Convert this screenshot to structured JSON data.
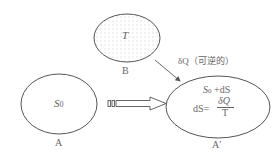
{
  "diagram": {
    "nodes": {
      "A": {
        "label": "A",
        "content": "S0",
        "content_main": "S",
        "content_sub": "0"
      },
      "B": {
        "label": "B",
        "content": "T"
      },
      "A_prime": {
        "label": "A′",
        "line1_main": "S",
        "line1_sub": "0",
        "line1_rest": " +dS",
        "line2_lhs": "dS=",
        "frac_num": "δQ",
        "frac_den": "T"
      }
    },
    "edges": {
      "heat_flow": {
        "label": "δQ（可逆的）",
        "from": "B",
        "to": "A′"
      },
      "process": {
        "from": "A",
        "to": "A′"
      }
    },
    "colors": {
      "stroke": "#555555",
      "text": "#666666",
      "dots": "#888888"
    }
  }
}
